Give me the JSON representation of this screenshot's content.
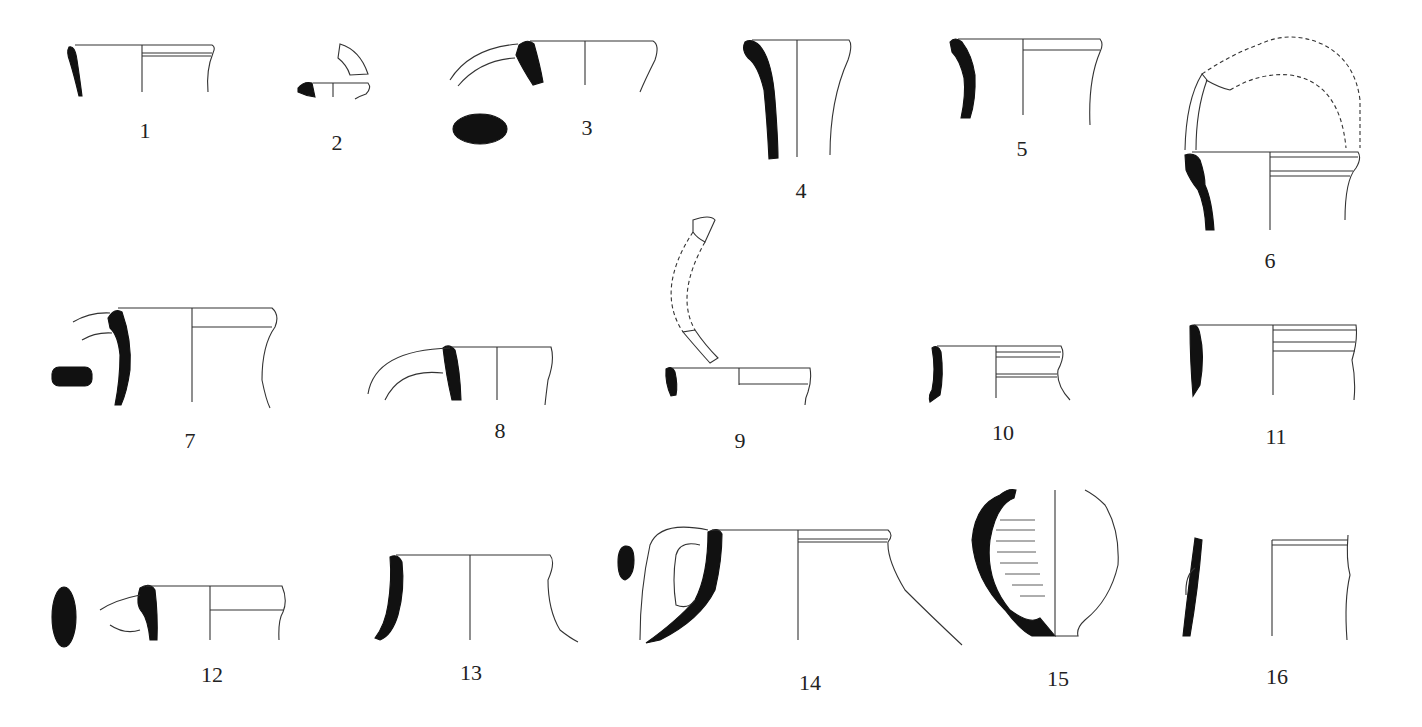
{
  "plate": {
    "type": "pottery-profile-drawings",
    "colors": {
      "section": "#111111",
      "outline": "#333333",
      "background": "#ffffff"
    },
    "items": [
      {
        "label": "1",
        "x": 145,
        "y": 118
      },
      {
        "label": "2",
        "x": 337,
        "y": 130
      },
      {
        "label": "3",
        "x": 587,
        "y": 115
      },
      {
        "label": "4",
        "x": 801,
        "y": 178
      },
      {
        "label": "5",
        "x": 1022,
        "y": 136
      },
      {
        "label": "6",
        "x": 1270,
        "y": 248
      },
      {
        "label": "7",
        "x": 190,
        "y": 428
      },
      {
        "label": "8",
        "x": 500,
        "y": 418
      },
      {
        "label": "9",
        "x": 740,
        "y": 428
      },
      {
        "label": "10",
        "x": 1003,
        "y": 420
      },
      {
        "label": "11",
        "x": 1276,
        "y": 424
      },
      {
        "label": "12",
        "x": 212,
        "y": 662
      },
      {
        "label": "13",
        "x": 471,
        "y": 660
      },
      {
        "label": "14",
        "x": 810,
        "y": 670
      },
      {
        "label": "15",
        "x": 1058,
        "y": 666
      },
      {
        "label": "16",
        "x": 1277,
        "y": 664
      }
    ]
  }
}
